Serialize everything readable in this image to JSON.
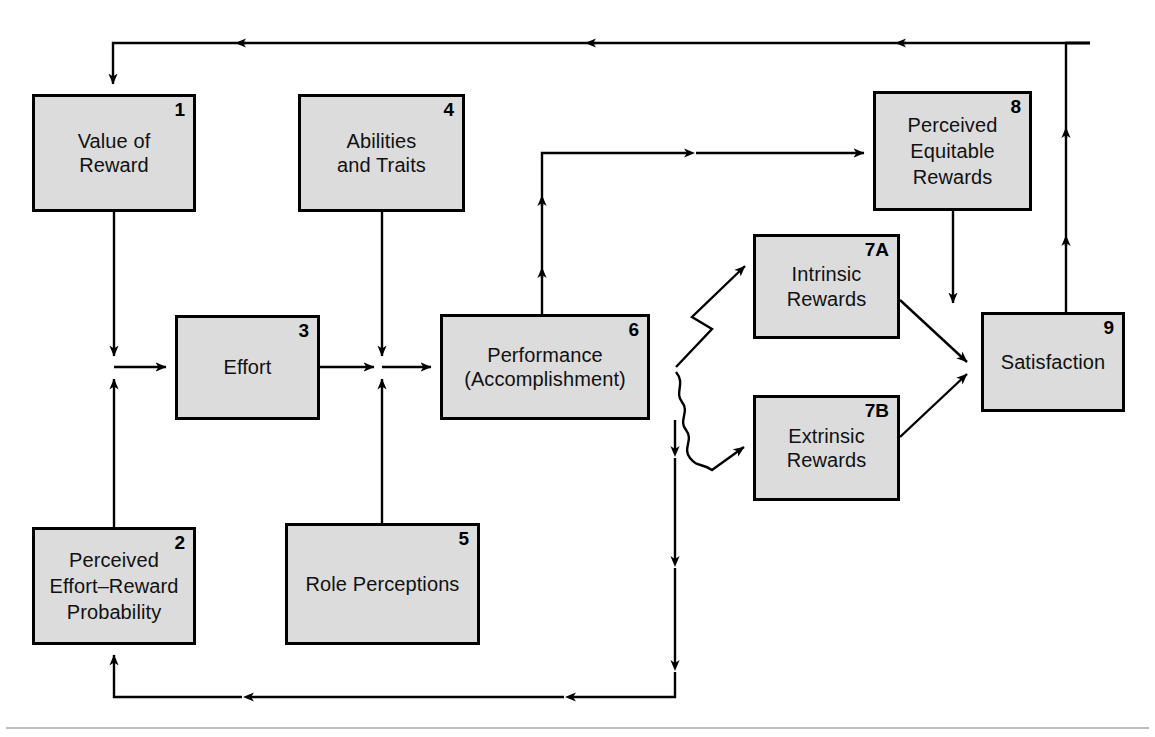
{
  "diagram": {
    "type": "flow-diagram",
    "nodes": [
      {
        "id": "1",
        "number": "1",
        "label": "Value of\nReward",
        "x": 32,
        "y": 94,
        "w": 164,
        "h": 118
      },
      {
        "id": "4",
        "number": "4",
        "label": "Abilities\nand Traits",
        "x": 298,
        "y": 94,
        "w": 167,
        "h": 118
      },
      {
        "id": "8",
        "number": "8",
        "label": "Perceived\nEquitable\nRewards",
        "x": 873,
        "y": 91,
        "w": 159,
        "h": 120
      },
      {
        "id": "7A",
        "number": "7A",
        "label": "Intrinsic\nRewards",
        "x": 753,
        "y": 234,
        "w": 147,
        "h": 105
      },
      {
        "id": "9",
        "number": "9",
        "label": "Satisfaction",
        "x": 981,
        "y": 312,
        "w": 144,
        "h": 100
      },
      {
        "id": "6",
        "number": "6",
        "label": "Performance\n(Accomplishment)",
        "x": 440,
        "y": 314,
        "w": 210,
        "h": 106
      },
      {
        "id": "3",
        "number": "3",
        "label": "Effort",
        "x": 175,
        "y": 315,
        "w": 145,
        "h": 105
      },
      {
        "id": "7B",
        "number": "7B",
        "label": "Extrinsic\nRewards",
        "x": 753,
        "y": 395,
        "w": 147,
        "h": 106
      },
      {
        "id": "2",
        "number": "2",
        "label": "Perceived\nEffort–Reward\nProbability",
        "x": 32,
        "y": 527,
        "w": 164,
        "h": 118
      },
      {
        "id": "5",
        "number": "5",
        "label": "Role Perceptions",
        "x": 285,
        "y": 523,
        "w": 195,
        "h": 122
      }
    ],
    "edges": [
      {
        "from": "1",
        "to": "3",
        "style": "orthogonal"
      },
      {
        "from": "2",
        "to": "3",
        "style": "orthogonal"
      },
      {
        "from": "3",
        "to": "6",
        "style": "orthogonal"
      },
      {
        "from": "4",
        "to": "6",
        "style": "orthogonal"
      },
      {
        "from": "5",
        "to": "6",
        "style": "orthogonal"
      },
      {
        "from": "6",
        "to": "8",
        "style": "orthogonal"
      },
      {
        "from": "6",
        "to": "7A",
        "style": "diagonal-jog"
      },
      {
        "from": "6",
        "to": "7B",
        "style": "wavy"
      },
      {
        "from": "7A",
        "to": "9",
        "style": "diagonal"
      },
      {
        "from": "7B",
        "to": "9",
        "style": "diagonal"
      },
      {
        "from": "8",
        "to": "9",
        "style": "orthogonal"
      },
      {
        "from": "9",
        "to": "1",
        "style": "feedback-top"
      },
      {
        "from": "6",
        "to": "2",
        "style": "feedback-bottom"
      }
    ],
    "colors": {
      "node_fill": "#dcdcdc",
      "node_border": "#000000",
      "line": "#000000",
      "text": "#111111",
      "background": "#ffffff"
    }
  }
}
